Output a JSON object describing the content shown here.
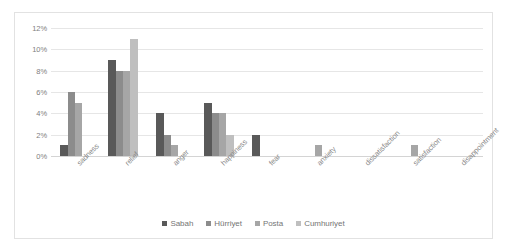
{
  "chart_data": {
    "type": "bar",
    "title": "",
    "subtitle": "",
    "xlabel": "",
    "ylabel": "",
    "ylim": [
      0,
      12
    ],
    "ytick_labels": [
      "0%",
      "2%",
      "4%",
      "6%",
      "8%",
      "10%",
      "12%"
    ],
    "ytick_values": [
      0,
      2,
      4,
      6,
      8,
      10,
      12
    ],
    "grid": true,
    "legend_position": "bottom-center",
    "value_unit": "%",
    "categories": [
      "sadness",
      "relief",
      "anger",
      "happiness",
      "fear",
      "anxiety",
      "dissatisfaction",
      "satisfaction",
      "disappointment"
    ],
    "series": [
      {
        "name": "Sabah",
        "color": "#595959",
        "values": [
          1,
          9,
          4,
          5,
          2,
          0,
          0,
          0,
          0
        ]
      },
      {
        "name": "Hürriyet",
        "color": "#8c8c8c",
        "values": [
          6,
          8,
          2,
          4,
          0,
          0,
          0,
          0,
          0
        ]
      },
      {
        "name": "Posta",
        "color": "#a6a6a6",
        "values": [
          5,
          8,
          1,
          4,
          0,
          1,
          0,
          1,
          0
        ]
      },
      {
        "name": "Cumhuriyet",
        "color": "#bfbfbf",
        "values": [
          0,
          11,
          0,
          2,
          0,
          0,
          0,
          0,
          0
        ]
      }
    ]
  },
  "legend": {
    "items": [
      {
        "label": "Sabah"
      },
      {
        "label": "Hürriyet"
      },
      {
        "label": "Posta"
      },
      {
        "label": "Cumhuriyet"
      }
    ]
  }
}
